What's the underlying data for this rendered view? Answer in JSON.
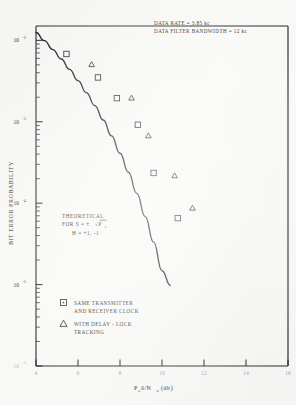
{
  "chart_data": {
    "type": "scatter",
    "title": "",
    "xlabel": "Pₛδ/N₀  (db)",
    "ylabel": "BIT ERROR PROBABILITY",
    "xlim": [
      4,
      16
    ],
    "ylim": [
      1e-06,
      0.015
    ],
    "yscale": "log",
    "xscale": "linear",
    "grid": false,
    "legend_position": "bottom-left",
    "xticks": [
      4,
      6,
      8,
      10,
      12,
      14,
      16
    ],
    "xtick_labels": [
      "4",
      "6",
      "8",
      "10",
      "12",
      "14",
      "16"
    ],
    "ytick_labels": [
      "10",
      "10",
      "10",
      "10",
      "10"
    ],
    "ytick_exponents": [
      "-2",
      "-3",
      "-4",
      "-5",
      "-6"
    ],
    "ytick_values": [
      0.01,
      0.001,
      0.0001,
      1e-05,
      1e-06
    ],
    "annotations": [
      {
        "text": "DATA RATE  =  3.85 kc",
        "x": 9.1,
        "y": 0.0125
      },
      {
        "text": "DATA FILTER BANDWIDTH  =  12 kc",
        "x": 9.1,
        "y": 0.0105
      }
    ],
    "theory_label_lines": [
      "THEORETICAL",
      "FOR  S  =  ±√P",
      "H  =  +1, -1"
    ],
    "theory_label_subscript": "s",
    "series": [
      {
        "name": "SAME TRANSMITTER AND RECEIVER CLOCK",
        "marker": "square",
        "x": [
          5.45,
          6.95,
          7.85,
          8.85,
          9.6,
          10.75
        ],
        "y": [
          0.0068,
          0.0035,
          0.00195,
          0.00092,
          0.000235,
          6.55e-05
        ]
      },
      {
        "name": "WITH DELAY-LOCK TRACKING",
        "marker": "triangle",
        "x": [
          6.65,
          8.55,
          9.35,
          10.6,
          11.45
        ],
        "y": [
          0.0051,
          0.00198,
          0.00068,
          0.00022,
          8.8e-05
        ]
      }
    ],
    "theory_curve": {
      "name": "THEORETICAL",
      "x": [
        4.0,
        4.4,
        4.8,
        5.2,
        5.6,
        6.0,
        6.4,
        6.8,
        7.2,
        7.6,
        8.0,
        8.4,
        8.8,
        9.2,
        9.6,
        10.0,
        10.4
      ],
      "y": [
        0.0125,
        0.0099,
        0.0077,
        0.0059,
        0.0044,
        0.0032,
        0.00228,
        0.00158,
        0.00105,
        0.00067,
        0.00041,
        0.00024,
        0.000132,
        6.85e-05,
        3.32e-05,
        1.48e-05,
        9.8e-06
      ]
    }
  },
  "legend": {
    "items": [
      {
        "marker": "square",
        "line1": "SAME TRANSMITTER",
        "line2": "AND RECEIVER CLOCK"
      },
      {
        "marker": "triangle",
        "line1": "WITH DELAY - LOCK",
        "line2": "TRACKING"
      }
    ]
  },
  "notes": {
    "line1": "DATA RATE  =  3.85 kc",
    "line2": "DATA FILTER BANDWIDTH  =  12 kc"
  },
  "theory_annotation": {
    "line1": "THEORETICAL",
    "line2_pre": "FOR  S  =  ±",
    "line2_radical": "√P",
    "line2_sub": "s",
    "line3": "H  =  +1, -1"
  },
  "axes": {
    "x_title_main": "P",
    "x_title_sub1": "s",
    "x_title_mid": "δ/N",
    "x_title_sub2": "o",
    "x_title_unit": "(db)",
    "y_title": "BIT ERROR PROBABILITY"
  }
}
